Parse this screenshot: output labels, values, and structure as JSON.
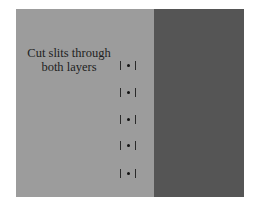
{
  "diagram": {
    "label_line1": "Cut slits through",
    "label_line2": "both layers",
    "colors": {
      "left_layer": "#9c9c9c",
      "right_layer": "#555555",
      "marks": "#222222"
    },
    "slits": [
      {
        "index": 1,
        "y": 61
      },
      {
        "index": 2,
        "y": 88
      },
      {
        "index": 3,
        "y": 115
      },
      {
        "index": 4,
        "y": 141
      },
      {
        "index": 5,
        "y": 169
      }
    ]
  }
}
